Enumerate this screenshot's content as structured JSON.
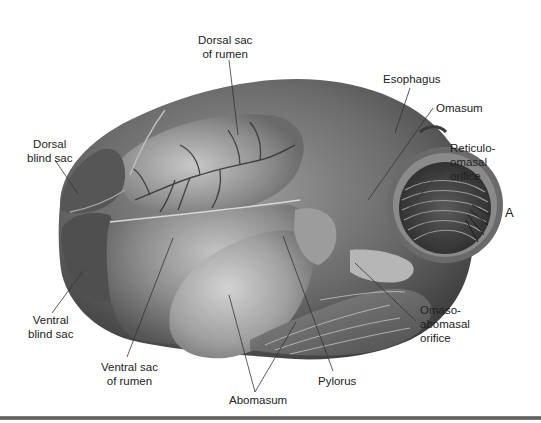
{
  "figure": {
    "panel_letter": "A",
    "colors": {
      "background": "#ffffff",
      "tissue_dark": "#4a4a4a",
      "tissue_mid": "#7a7a7a",
      "tissue_light": "#bdbdbd",
      "label_text": "#222222",
      "leader_line": "#333333",
      "bottom_rule": "#666666"
    },
    "labels": [
      {
        "id": "dorsal-sac-of-rumen",
        "text": "Dorsal sac\nof rumen"
      },
      {
        "id": "dorsal-blind-sac",
        "text": "Dorsal\nblind sac"
      },
      {
        "id": "esophagus",
        "text": "Esophagus"
      },
      {
        "id": "omasum",
        "text": "Omasum"
      },
      {
        "id": "reticulo-omasal-orifice",
        "text": "Reticulo-\nomasal\norifice"
      },
      {
        "id": "ventral-blind-sac",
        "text": "Ventral\nblind sac"
      },
      {
        "id": "ventral-sac-of-rumen",
        "text": "Ventral sac\nof rumen"
      },
      {
        "id": "abomasum",
        "text": "Abomasum"
      },
      {
        "id": "pylorus",
        "text": "Pylorus"
      },
      {
        "id": "omaso-abomasal-orifice",
        "text": "Omaso-\nabomasal\norifice"
      }
    ]
  }
}
